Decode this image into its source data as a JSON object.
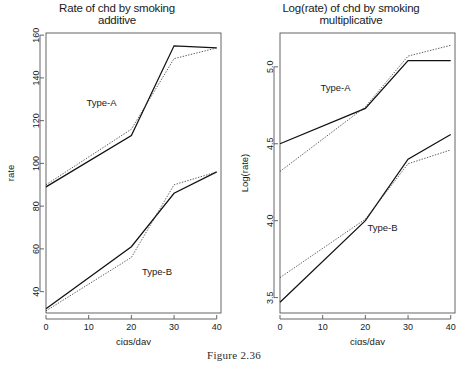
{
  "caption": "Figure 2.36",
  "panels": [
    {
      "id": "additive",
      "title_line1": "Rate of chd by smoking",
      "title_line2": "additive",
      "xlabel": "cigs/day",
      "ylabel": "rate",
      "series_labels": {
        "type_a": "Type-A",
        "type_b": "Type-B"
      }
    },
    {
      "id": "multiplicative",
      "title_line1": "Log(rate) of chd by smoking",
      "title_line2": "multiplicative",
      "xlabel": "cigs/day",
      "ylabel": "Log(rate)",
      "series_labels": {
        "type_a": "Type-A",
        "type_b": "Type-B"
      }
    }
  ],
  "chart_data": [
    {
      "type": "line",
      "title": "Rate of chd by smoking additive",
      "xlabel": "cigs/day",
      "ylabel": "rate",
      "x": [
        0,
        20,
        30,
        40
      ],
      "xlim": [
        0,
        41
      ],
      "ylim": [
        30,
        161
      ],
      "xticks": [
        0,
        10,
        20,
        30,
        40
      ],
      "yticks": [
        40,
        60,
        80,
        100,
        120,
        140,
        160
      ],
      "grid": false,
      "legend": "inline-annotations",
      "series": [
        {
          "name": "Type-A fitted",
          "group": "Type-A",
          "style": "solid",
          "values": [
            89,
            113,
            155,
            154
          ]
        },
        {
          "name": "Type-A observed",
          "group": "Type-A",
          "style": "dotted",
          "values": [
            90,
            116,
            149,
            154
          ]
        },
        {
          "name": "Type-B fitted",
          "group": "Type-B",
          "style": "solid",
          "values": [
            32,
            61,
            86,
            96
          ]
        },
        {
          "name": "Type-B observed",
          "group": "Type-B",
          "style": "dotted",
          "values": [
            31,
            56,
            90,
            96
          ]
        }
      ],
      "annotations": [
        {
          "text": "Type-A",
          "x": 13,
          "y": 127
        },
        {
          "text": "Type-B",
          "x": 26,
          "y": 48
        }
      ]
    },
    {
      "type": "line",
      "title": "Log(rate) of chd by smoking multiplicative",
      "xlabel": "cigs/day",
      "ylabel": "Log(rate)",
      "x": [
        0,
        20,
        30,
        40
      ],
      "xlim": [
        0,
        41
      ],
      "ylim": [
        3.4,
        5.22
      ],
      "xticks": [
        0,
        10,
        20,
        30,
        40
      ],
      "yticks": [
        3.5,
        4.0,
        4.5,
        5.0
      ],
      "grid": false,
      "legend": "inline-annotations",
      "series": [
        {
          "name": "Type-A fitted",
          "group": "Type-A",
          "style": "solid",
          "values": [
            4.5,
            4.73,
            5.04,
            5.04
          ]
        },
        {
          "name": "Type-A observed",
          "group": "Type-A",
          "style": "dotted",
          "values": [
            4.32,
            4.74,
            5.07,
            5.14
          ]
        },
        {
          "name": "Type-B fitted",
          "group": "Type-B",
          "style": "solid",
          "values": [
            3.47,
            4.0,
            4.4,
            4.56
          ]
        },
        {
          "name": "Type-B observed",
          "group": "Type-B",
          "style": "dotted",
          "values": [
            3.63,
            4.01,
            4.37,
            4.46
          ]
        }
      ],
      "annotations": [
        {
          "text": "Type-A",
          "x": 13,
          "y": 4.84
        },
        {
          "text": "Type-B",
          "x": 24,
          "y": 3.93
        }
      ]
    }
  ]
}
